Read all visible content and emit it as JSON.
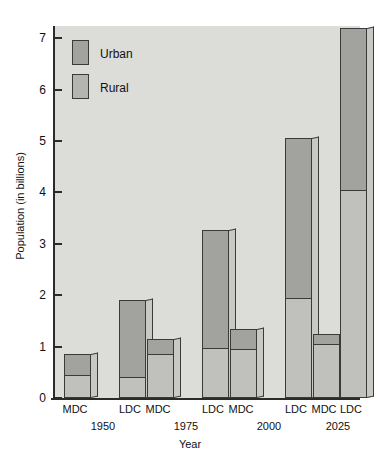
{
  "chart_data": {
    "type": "bar",
    "title": "",
    "subtitle": "",
    "xlabel": "Year",
    "ylabel": "Population (in billions)",
    "ylim": [
      0,
      7.4
    ],
    "yticks": [
      0,
      1,
      2,
      3,
      4,
      5,
      6,
      7
    ],
    "ytick_labels": [
      "0",
      "1",
      "2",
      "3",
      "4",
      "5",
      "6",
      "7"
    ],
    "grid": false,
    "stacked": true,
    "legend_position": "upper-left-inside",
    "legend": [
      "Urban",
      "Rural"
    ],
    "colors": {
      "urban": "#a2a29e",
      "rural": "#c0c0bc",
      "plot_background": "#dcdcd8",
      "axis": "#2b2b2b",
      "bar_outline": "#3a3a3a"
    },
    "categories": [
      "MDC",
      "LDC",
      "MDC",
      "LDC",
      "MDC",
      "LDC",
      "MDC",
      "LDC"
    ],
    "groups": [
      "1950",
      "1975",
      "2000",
      "2025"
    ],
    "series": [
      {
        "name": "Urban",
        "values": [
          0.4,
          1.5,
          0.3,
          2.3,
          0.4,
          3.1,
          0.2,
          3.15
        ]
      },
      {
        "name": "Rural",
        "values": [
          0.45,
          0.4,
          0.85,
          0.97,
          0.95,
          1.95,
          1.05,
          4.05
        ]
      }
    ],
    "totals": [
      0.85,
      1.9,
      1.15,
      3.27,
      1.35,
      5.05,
      1.25,
      7.2
    ],
    "bars": [
      {
        "group": "1950",
        "category": "MDC",
        "urban": 0.4,
        "total": 0.85
      },
      {
        "group": "1950",
        "category": "LDC",
        "urban": 1.5,
        "total": 1.9
      },
      {
        "group": "1975",
        "category": "MDC",
        "urban": 0.3,
        "total": 1.15
      },
      {
        "group": "1975",
        "category": "LDC",
        "urban": 2.3,
        "total": 3.27
      },
      {
        "group": "2000",
        "category": "MDC",
        "urban": 0.4,
        "total": 1.35
      },
      {
        "group": "2000",
        "category": "LDC",
        "urban": 3.1,
        "total": 5.05
      },
      {
        "group": "2025",
        "category": "MDC",
        "urban": 0.2,
        "total": 1.25
      },
      {
        "group": "2025",
        "category": "LDC",
        "urban": 3.15,
        "total": 7.2
      }
    ]
  },
  "axes": {
    "y_title": "Population (in billions)",
    "x_title": "Year",
    "y_ticks": [
      "7",
      "6",
      "5",
      "4",
      "3",
      "2",
      "1",
      "0"
    ]
  },
  "legend": {
    "urban_label": "Urban",
    "rural_label": "Rural"
  },
  "x_labels": {
    "categories": [
      "MDC",
      "LDC",
      "MDC",
      "LDC",
      "MDC",
      "LDC",
      "MDC",
      "LDC"
    ],
    "groups": [
      "1950",
      "1975",
      "2000",
      "2025"
    ]
  }
}
